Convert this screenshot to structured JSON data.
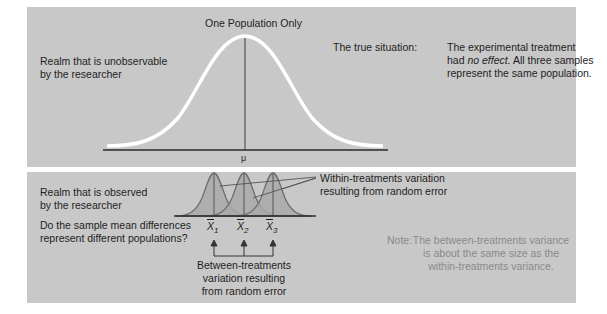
{
  "top_panel": {
    "title": "One Population Only",
    "realm_label_line1": "Realm that is unobservable",
    "realm_label_line2": "by the researcher",
    "true_situation_label": "The true situation:",
    "true_situation_line1": "The experimental treatment",
    "true_situation_line2_prefix": "had ",
    "true_situation_line2_italic": "no effect.",
    "true_situation_line2_suffix": " All three samples",
    "true_situation_line3": "represent the same population.",
    "axis_label_mu": "μ"
  },
  "bottom_panel": {
    "realm_label_line1": "Realm that is observed",
    "realm_label_line2": "by the researcher",
    "question_line1": "Do the sample mean differences",
    "question_line2": "represent different populations?",
    "within_label_line1": "Within-treatments variation",
    "within_label_line2": "resulting from random error",
    "sample_means": [
      {
        "symbol": "X",
        "subscript": "1"
      },
      {
        "symbol": "X",
        "subscript": "2"
      },
      {
        "symbol": "X",
        "subscript": "3"
      }
    ],
    "between_label_line1": "Between-treatments",
    "between_label_line2": "variation resulting",
    "between_label_line3": "from random error",
    "note_prefix": "Note:",
    "note_line1": "The between-treatments variance",
    "note_line2": "is about the same size as the",
    "note_line3": "within-treatments variance."
  },
  "colors": {
    "panel_bg": "#c8c8c8",
    "curve_white": "#ffffff",
    "small_curve_fill": "#a9a9a9",
    "small_curve_stroke": "#6e6e6e",
    "note_text": "#8a8a8a"
  }
}
